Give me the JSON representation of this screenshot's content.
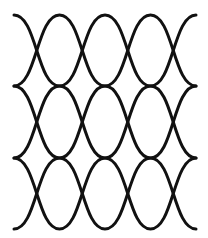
{
  "pattern": {
    "name": "ogee-wave-lattice",
    "background": "#ffffff",
    "stroke_color": "#111111",
    "stroke_width": 3,
    "x_start": 14,
    "x_end": 196,
    "half_period": 45.5,
    "bands": [
      {
        "top": 15,
        "bottom": 86
      },
      {
        "top": 86,
        "bottom": 158
      },
      {
        "top": 158,
        "bottom": 229
      }
    ]
  }
}
